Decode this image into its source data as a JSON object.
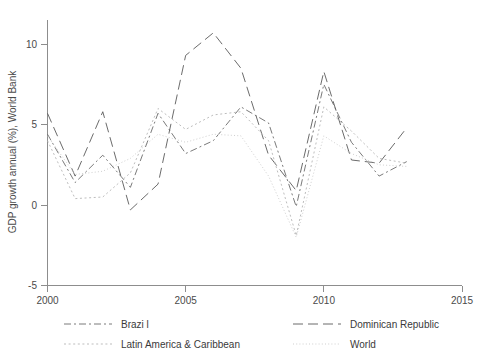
{
  "chart_data": {
    "type": "line",
    "title": "",
    "xlabel": "",
    "ylabel": "GDP growth annual (%), World Bank",
    "xlim": [
      2000,
      2015
    ],
    "ylim": [
      -5,
      11.5
    ],
    "grid": false,
    "legend_position": "bottom",
    "xticks": [
      "2000",
      "2005",
      "2010",
      "2015"
    ],
    "xtick_values": [
      2000,
      2005,
      2010,
      2015
    ],
    "yticks": [
      "-5",
      "0",
      "5",
      "10"
    ],
    "ytick_values": [
      -5,
      0,
      5,
      10
    ],
    "x": [
      2000,
      2001,
      2002,
      2003,
      2004,
      2005,
      2006,
      2007,
      2008,
      2009,
      2010,
      2011,
      2012,
      2013
    ],
    "series": [
      {
        "name": "Brazi l",
        "legend_label": "Brazi l",
        "dash": "dash-dot",
        "color": "#6b6b6b",
        "values": [
          4.4,
          1.4,
          3.1,
          1.1,
          5.7,
          3.2,
          4.0,
          6.1,
          5.1,
          -0.1,
          7.5,
          3.9,
          1.8,
          2.7
        ]
      },
      {
        "name": "Dominican Republic",
        "legend_label": "Dominican Republic",
        "dash": "long-dash",
        "color": "#5a5a5a",
        "values": [
          5.7,
          1.8,
          5.8,
          -0.3,
          1.3,
          9.3,
          10.7,
          8.5,
          3.1,
          0.9,
          8.3,
          2.8,
          2.6,
          4.8
        ]
      },
      {
        "name": "Latin America & Caribbean",
        "legend_label": "Latin America & Caribbean",
        "dash": "dotted",
        "color": "#b5b5b5",
        "values": [
          4.0,
          0.4,
          0.5,
          2.0,
          6.0,
          4.7,
          5.6,
          5.8,
          4.0,
          -1.9,
          6.1,
          4.6,
          2.9,
          2.6
        ]
      },
      {
        "name": "World",
        "legend_label": "World",
        "dash": "fine-dotted",
        "color": "#c9c9c9",
        "values": [
          4.3,
          1.9,
          2.1,
          2.9,
          4.4,
          3.9,
          4.4,
          4.3,
          1.8,
          -2.0,
          4.3,
          3.2,
          2.5,
          2.4
        ]
      }
    ]
  },
  "axes": {
    "ylabel": "GDP growth annual (%), World Bank"
  },
  "legend": {
    "entries": [
      {
        "label": "Brazi l"
      },
      {
        "label": "Dominican Republic"
      },
      {
        "label": "Latin America & Caribbean"
      },
      {
        "label": "World"
      }
    ]
  }
}
